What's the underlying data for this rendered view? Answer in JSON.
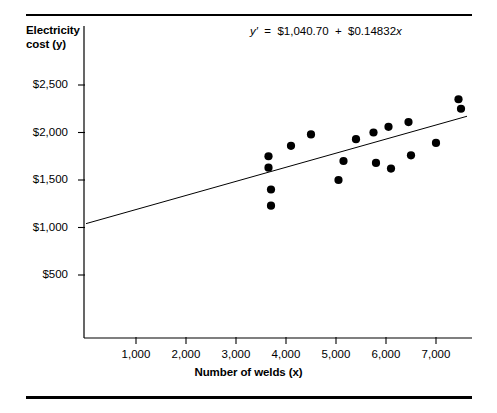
{
  "figure": {
    "equation_text": "y′  =  $1,040.70  +  $0.14832x",
    "equation_parts": {
      "lhs": "y′",
      "eq": "=",
      "intercept": "$1,040.70",
      "plus": "+",
      "slope": "$0.14832",
      "x_var": "x"
    }
  },
  "chart_data": {
    "type": "scatter",
    "title": "",
    "xlabel": "Number of welds (x)",
    "ylabel": "Electricity cost (y)",
    "ylabel_line1": "Electricity",
    "ylabel_line2": "cost (y)",
    "xlim": [
      0,
      8000
    ],
    "ylim": [
      0,
      2750
    ],
    "grid": false,
    "legend": null,
    "xticks": [
      1000,
      2000,
      3000,
      4000,
      5000,
      6000,
      7000
    ],
    "xtick_labels": [
      "1,000",
      "2,000",
      "3,000",
      "4,000",
      "5,000",
      "6,000",
      "7,000"
    ],
    "yticks": [
      500,
      1000,
      1500,
      2000,
      2500
    ],
    "ytick_labels": [
      "$500",
      "$1,000",
      "$1,500",
      "$2,000",
      "$2,500"
    ],
    "point_color": "#000000",
    "line_color": "#000000",
    "points": [
      {
        "x": 3650,
        "y": 1750
      },
      {
        "x": 3650,
        "y": 1630
      },
      {
        "x": 3700,
        "y": 1400
      },
      {
        "x": 3700,
        "y": 1230
      },
      {
        "x": 4100,
        "y": 1860
      },
      {
        "x": 4500,
        "y": 1980
      },
      {
        "x": 5050,
        "y": 1500
      },
      {
        "x": 5150,
        "y": 1700
      },
      {
        "x": 5400,
        "y": 1930
      },
      {
        "x": 5750,
        "y": 2000
      },
      {
        "x": 5800,
        "y": 1680
      },
      {
        "x": 6050,
        "y": 2060
      },
      {
        "x": 6100,
        "y": 1620
      },
      {
        "x": 6450,
        "y": 2110
      },
      {
        "x": 6500,
        "y": 1760
      },
      {
        "x": 7000,
        "y": 1890
      },
      {
        "x": 7450,
        "y": 2350
      },
      {
        "x": 7500,
        "y": 2250
      }
    ],
    "regression": {
      "label": "y′ = $1,040.70 + $0.14832x",
      "intercept": 1040.7,
      "slope": 0.14832,
      "x_start": 0,
      "x_end": 7620
    }
  }
}
